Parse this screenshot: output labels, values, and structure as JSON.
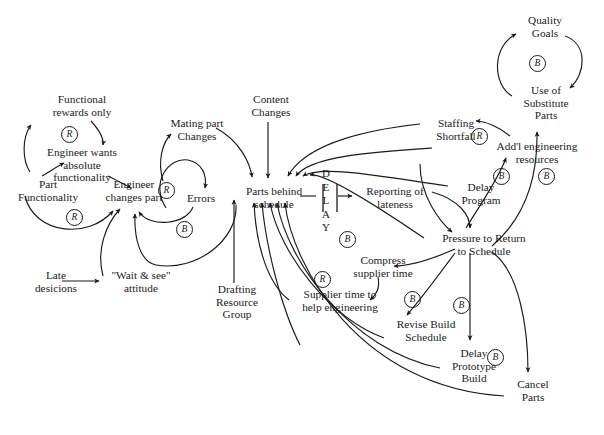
{
  "diagram": {
    "background_color": "#ffffff",
    "line_color": "#1b1b1b",
    "text_color": "#1b1b1b"
  },
  "nodes": [
    {
      "id": "functional-rewards-only",
      "label": "Functional\nrewards only",
      "x": 32,
      "y": 93,
      "w": 100
    },
    {
      "id": "engineer-wants-functionality",
      "label": "Engineer wants\nabsolute\nfunctionality",
      "x": 30,
      "y": 146,
      "w": 104
    },
    {
      "id": "part-functionality",
      "label": "Part\nFunctionality",
      "x": 6,
      "y": 178,
      "w": 84
    },
    {
      "id": "engineer-changes-part",
      "label": "Engineer\nchanges part",
      "x": 93,
      "y": 178,
      "w": 82
    },
    {
      "id": "mating-part-changes",
      "label": "Mating part\nChanges",
      "x": 158,
      "y": 117,
      "w": 78
    },
    {
      "id": "errors",
      "label": "Errors",
      "x": 178,
      "y": 192,
      "w": 46
    },
    {
      "id": "late-decisions",
      "label": "Late\ndesicions",
      "x": 25,
      "y": 269,
      "w": 62
    },
    {
      "id": "wait-and-see-attitude",
      "label": "\"Wait & see\"\nattitude",
      "x": 103,
      "y": 269,
      "w": 76
    },
    {
      "id": "content-changes",
      "label": "Content\nChanges",
      "x": 238,
      "y": 93,
      "w": 66
    },
    {
      "id": "parts-behind-schedule",
      "label": "Parts behind\nschedule",
      "x": 232,
      "y": 185,
      "w": 84
    },
    {
      "id": "drafting-resource-group",
      "label": "Drafting\nResource\nGroup",
      "x": 204,
      "y": 283,
      "w": 66
    },
    {
      "id": "reporting-of-lateness",
      "label": "Reporting of\nlateness",
      "x": 355,
      "y": 185,
      "w": 80
    },
    {
      "id": "supplier-time-help-engineering",
      "label": "Supplier time to\nhelp engineering",
      "x": 288,
      "y": 288,
      "w": 104
    },
    {
      "id": "compress-supplier-time",
      "label": "Compress\nsupplier time",
      "x": 340,
      "y": 254,
      "w": 86
    },
    {
      "id": "quality-goals",
      "label": "Quality\nGoals",
      "x": 514,
      "y": 14,
      "w": 62
    },
    {
      "id": "use-of-substitute-parts",
      "label": "Use of\nSubstitute\nParts",
      "x": 512,
      "y": 84,
      "w": 68
    },
    {
      "id": "staffing-shortfall",
      "label": "Staffing\nShortfall",
      "x": 425,
      "y": 117,
      "w": 62
    },
    {
      "id": "addl-engineering-resources",
      "label": "Add'l engineering\nresources",
      "x": 481,
      "y": 140,
      "w": 112
    },
    {
      "id": "delay-program",
      "label": "Delay\nProgram",
      "x": 452,
      "y": 181,
      "w": 58
    },
    {
      "id": "pressure-to-return-schedule",
      "label": "Pressure to Return\nto Schedule",
      "x": 428,
      "y": 232,
      "w": 112
    },
    {
      "id": "revise-build-schedule",
      "label": "Revise Build\nSchedule",
      "x": 385,
      "y": 318,
      "w": 82
    },
    {
      "id": "delay-prototype-build",
      "label": "Delay\nPrototype\nBuild",
      "x": 441,
      "y": 347,
      "w": 66
    },
    {
      "id": "cancel-parts",
      "label": "Cancel\nParts",
      "x": 505,
      "y": 378,
      "w": 56
    }
  ],
  "loop_markers": [
    {
      "id": "marker-r-rewards",
      "type": "R",
      "x": 61,
      "y": 126
    },
    {
      "id": "marker-r-functionality",
      "type": "R",
      "x": 66,
      "y": 209
    },
    {
      "id": "marker-r-errors",
      "type": "R",
      "x": 158,
      "y": 182
    },
    {
      "id": "marker-b-errors",
      "type": "B",
      "x": 176,
      "y": 221
    },
    {
      "id": "marker-b-delay",
      "type": "B",
      "x": 339,
      "y": 231
    },
    {
      "id": "marker-r-supplier",
      "type": "R",
      "x": 314,
      "y": 271
    },
    {
      "id": "marker-b-compress",
      "type": "B",
      "x": 404,
      "y": 291
    },
    {
      "id": "marker-b-revise",
      "type": "B",
      "x": 453,
      "y": 297
    },
    {
      "id": "marker-b-prototype",
      "type": "B",
      "x": 487,
      "y": 349
    },
    {
      "id": "marker-r-staffing",
      "type": "R",
      "x": 471,
      "y": 128
    },
    {
      "id": "marker-b-quality",
      "type": "B",
      "x": 529,
      "y": 55
    },
    {
      "id": "marker-b-delay-program",
      "type": "B",
      "x": 493,
      "y": 168
    },
    {
      "id": "marker-b-addl-right",
      "type": "B",
      "x": 538,
      "y": 168
    }
  ],
  "delay_symbol": {
    "id": "delay-marker",
    "letters": [
      "D",
      "E",
      "L",
      "A",
      "Y"
    ],
    "x": 322,
    "y": 167
  }
}
